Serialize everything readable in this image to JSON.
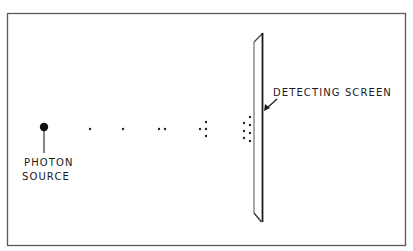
{
  "diagram": {
    "title_fragment": "",
    "frame": {
      "x": 7,
      "y": 13,
      "width": 399,
      "height": 233,
      "stroke": "#5a5a5a"
    },
    "source": {
      "label_lines": [
        "PHOTON",
        "SOURCE"
      ],
      "dot": {
        "cx": 44,
        "cy": 127,
        "r": 4.2
      },
      "stem": {
        "x": 44,
        "y1": 131,
        "y2": 153
      }
    },
    "screen": {
      "label": "DETECTING SCREEN",
      "outline": "254,42 263,33 263,222 261,222 254,213",
      "left_edge_color": "#7a7a7a",
      "right_edge_color": "#1a1a1a"
    },
    "photon_groups": [
      {
        "count": 1,
        "dots": [
          [
            90,
            129
          ]
        ]
      },
      {
        "count": 1,
        "dots": [
          [
            123,
            129
          ]
        ]
      },
      {
        "count": 2,
        "dots": [
          [
            159,
            129
          ],
          [
            165,
            129
          ]
        ]
      },
      {
        "count": 4,
        "dots": [
          [
            200,
            129
          ],
          [
            206,
            122
          ],
          [
            206,
            129
          ],
          [
            206,
            136
          ]
        ]
      },
      {
        "count": 7,
        "dots": [
          [
            250,
            117
          ],
          [
            244,
            123
          ],
          [
            250,
            125
          ],
          [
            244,
            131
          ],
          [
            250,
            133
          ],
          [
            244,
            138
          ],
          [
            250,
            141
          ]
        ]
      }
    ],
    "arrow": {
      "x1": 277,
      "y1": 99,
      "x2": 265,
      "y2": 109
    },
    "colors": {
      "ink": "#1a1a1a",
      "background": "#ffffff"
    }
  }
}
